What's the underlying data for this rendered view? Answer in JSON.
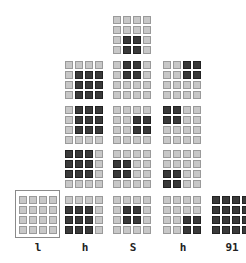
{
  "diagram": {
    "colors": {
      "off": "#c8c8c8",
      "on": "#3a3a3a",
      "background": "#ffffff"
    },
    "grids": [
      {
        "id": "c1r4",
        "x": 19,
        "y": 196,
        "on": []
      },
      {
        "id": "c2r1",
        "x": 65,
        "y": 61,
        "on": [
          [
            1,
            1
          ],
          [
            1,
            2
          ],
          [
            1,
            3
          ],
          [
            2,
            1
          ],
          [
            2,
            2
          ],
          [
            2,
            3
          ],
          [
            3,
            1
          ],
          [
            3,
            2
          ],
          [
            3,
            3
          ]
        ]
      },
      {
        "id": "c2r2",
        "x": 65,
        "y": 106,
        "on": [
          [
            0,
            1
          ],
          [
            0,
            2
          ],
          [
            0,
            3
          ],
          [
            1,
            1
          ],
          [
            1,
            2
          ],
          [
            1,
            3
          ],
          [
            2,
            1
          ],
          [
            2,
            2
          ],
          [
            2,
            3
          ]
        ]
      },
      {
        "id": "c2r3",
        "x": 65,
        "y": 150,
        "on": [
          [
            0,
            0
          ],
          [
            0,
            1
          ],
          [
            0,
            2
          ],
          [
            1,
            0
          ],
          [
            1,
            1
          ],
          [
            1,
            2
          ],
          [
            2,
            0
          ],
          [
            2,
            1
          ],
          [
            2,
            2
          ]
        ]
      },
      {
        "id": "c2r4",
        "x": 65,
        "y": 196,
        "on": [
          [
            1,
            0
          ],
          [
            1,
            1
          ],
          [
            1,
            2
          ],
          [
            2,
            0
          ],
          [
            2,
            1
          ],
          [
            2,
            2
          ],
          [
            3,
            0
          ],
          [
            3,
            1
          ],
          [
            3,
            2
          ]
        ]
      },
      {
        "id": "c3r0",
        "x": 113,
        "y": 16,
        "on": [
          [
            2,
            1
          ],
          [
            2,
            2
          ],
          [
            3,
            1
          ],
          [
            3,
            2
          ]
        ]
      },
      {
        "id": "c3r1",
        "x": 113,
        "y": 61,
        "on": [
          [
            0,
            1
          ],
          [
            0,
            2
          ],
          [
            1,
            1
          ],
          [
            1,
            2
          ]
        ]
      },
      {
        "id": "c3r2",
        "x": 113,
        "y": 106,
        "on": [
          [
            1,
            2
          ],
          [
            1,
            3
          ],
          [
            2,
            2
          ],
          [
            2,
            3
          ]
        ]
      },
      {
        "id": "c3r3",
        "x": 113,
        "y": 150,
        "on": [
          [
            1,
            0
          ],
          [
            1,
            1
          ],
          [
            2,
            0
          ],
          [
            2,
            1
          ]
        ]
      },
      {
        "id": "c3r4",
        "x": 113,
        "y": 196,
        "on": [
          [
            1,
            1
          ],
          [
            1,
            2
          ],
          [
            2,
            1
          ],
          [
            2,
            2
          ]
        ]
      },
      {
        "id": "c4r1",
        "x": 163,
        "y": 61,
        "on": [
          [
            0,
            2
          ],
          [
            0,
            3
          ],
          [
            1,
            2
          ],
          [
            1,
            3
          ]
        ]
      },
      {
        "id": "c4r2",
        "x": 163,
        "y": 106,
        "on": [
          [
            0,
            0
          ],
          [
            0,
            1
          ],
          [
            1,
            0
          ],
          [
            1,
            1
          ]
        ]
      },
      {
        "id": "c4r3",
        "x": 163,
        "y": 150,
        "on": [
          [
            2,
            0
          ],
          [
            2,
            1
          ],
          [
            3,
            0
          ],
          [
            3,
            1
          ]
        ]
      },
      {
        "id": "c4r4",
        "x": 163,
        "y": 196,
        "on": [
          [
            2,
            2
          ],
          [
            2,
            3
          ],
          [
            3,
            2
          ],
          [
            3,
            3
          ]
        ]
      },
      {
        "id": "c5r4",
        "x": 212,
        "y": 196,
        "on": [
          [
            0,
            0
          ],
          [
            0,
            1
          ],
          [
            0,
            2
          ],
          [
            0,
            3
          ],
          [
            1,
            0
          ],
          [
            1,
            1
          ],
          [
            1,
            2
          ],
          [
            1,
            3
          ],
          [
            2,
            0
          ],
          [
            2,
            1
          ],
          [
            2,
            2
          ],
          [
            2,
            3
          ],
          [
            3,
            0
          ],
          [
            3,
            1
          ],
          [
            3,
            2
          ],
          [
            3,
            3
          ]
        ]
      }
    ],
    "frame": {
      "x": 15,
      "y": 190,
      "w": 45,
      "h": 48
    },
    "labels": [
      {
        "text": "l",
        "x": 18
      },
      {
        "text": "h",
        "x": 65
      },
      {
        "text": "S",
        "x": 113
      },
      {
        "text": "h",
        "x": 163
      },
      {
        "text": "91",
        "x": 212
      }
    ]
  }
}
